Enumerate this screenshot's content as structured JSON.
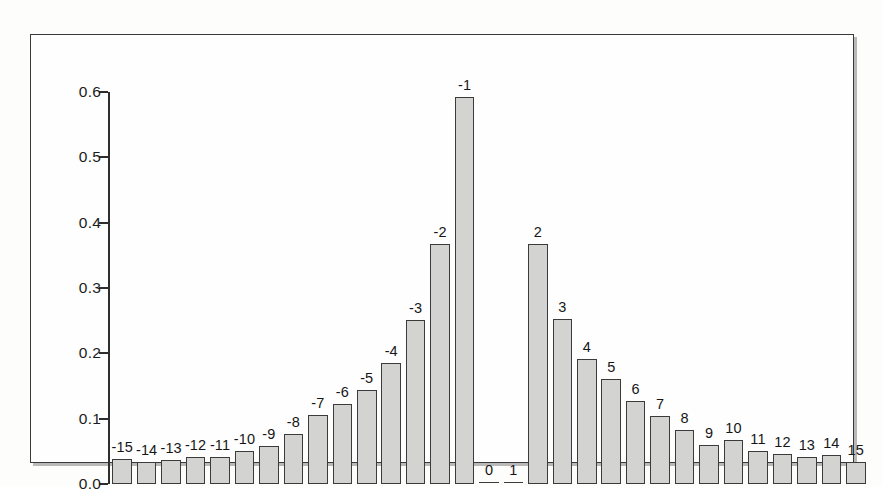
{
  "chart_data": {
    "type": "bar",
    "title": "",
    "subtitle": "",
    "xlabel": "",
    "ylabel": "",
    "ylim": [
      0.0,
      0.6
    ],
    "yticks": [
      "0.0",
      "0.1",
      "0.2",
      "0.3",
      "0.4",
      "0.5",
      "0.6"
    ],
    "ytick_values": [
      0.0,
      0.1,
      0.2,
      0.3,
      0.4,
      0.5,
      0.6
    ],
    "grid": false,
    "legend": null,
    "bar_fill_color": "#d3d3d1",
    "bar_edge_color": "#3b3b3b",
    "axis_color": "#2e2e2e",
    "frame_color": "#3a3a3a",
    "background_color": "#fefefe",
    "categories": [
      "-15",
      "-14",
      "-13",
      "-12",
      "-11",
      "-10",
      "-9",
      "-8",
      "-7",
      "-6",
      "-5",
      "-4",
      "-3",
      "-2",
      "-1",
      "0",
      "1",
      "2",
      "3",
      "4",
      "5",
      "6",
      "7",
      "8",
      "9",
      "10",
      "11",
      "12",
      "13",
      "14",
      "15"
    ],
    "values": [
      0.039,
      0.034,
      0.036,
      0.041,
      0.041,
      0.05,
      0.058,
      0.077,
      0.105,
      0.122,
      0.144,
      0.185,
      0.251,
      0.367,
      0.592,
      0.0,
      0.0,
      0.367,
      0.252,
      0.192,
      0.16,
      0.127,
      0.104,
      0.082,
      0.06,
      0.068,
      0.05,
      0.046,
      0.042,
      0.044,
      0.033
    ],
    "data_labels": [
      "-15",
      "-14",
      "-13",
      "-12",
      "-11",
      "-10",
      "-9",
      "-8",
      "-7",
      "-6",
      "-5",
      "-4",
      "-3",
      "-2",
      "-1",
      "0",
      "1",
      "2",
      "3",
      "4",
      "5",
      "6",
      "7",
      "8",
      "9",
      "10",
      "11",
      "12",
      "13",
      "14",
      "15"
    ]
  }
}
